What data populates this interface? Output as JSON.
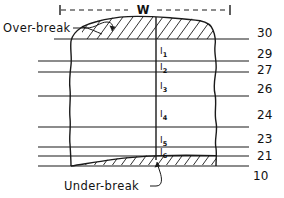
{
  "figure": {
    "type": "engineering-cross-section",
    "dimension_label": "W",
    "callouts": [
      {
        "id": "over-break",
        "text": "Over-break",
        "points_to": "upper hatched zone"
      },
      {
        "id": "under-break",
        "text": "Under-break",
        "points_to": "lower hatched zone"
      }
    ],
    "segment_labels": [
      {
        "name": "l1",
        "base": "l",
        "sub": "1"
      },
      {
        "name": "l2",
        "base": "l",
        "sub": "2"
      },
      {
        "name": "l3",
        "base": "l",
        "sub": "3"
      },
      {
        "name": "l4",
        "base": "l",
        "sub": "4"
      },
      {
        "name": "l5",
        "base": "l",
        "sub": "5"
      },
      {
        "name": "l6",
        "base": "l",
        "sub": "6"
      }
    ],
    "right_axis_values": [
      "30",
      "29",
      "27",
      "26",
      "24",
      "23",
      "21",
      "10"
    ],
    "colors": {
      "ink": "#1a1a1a",
      "background": "#ffffff"
    }
  }
}
